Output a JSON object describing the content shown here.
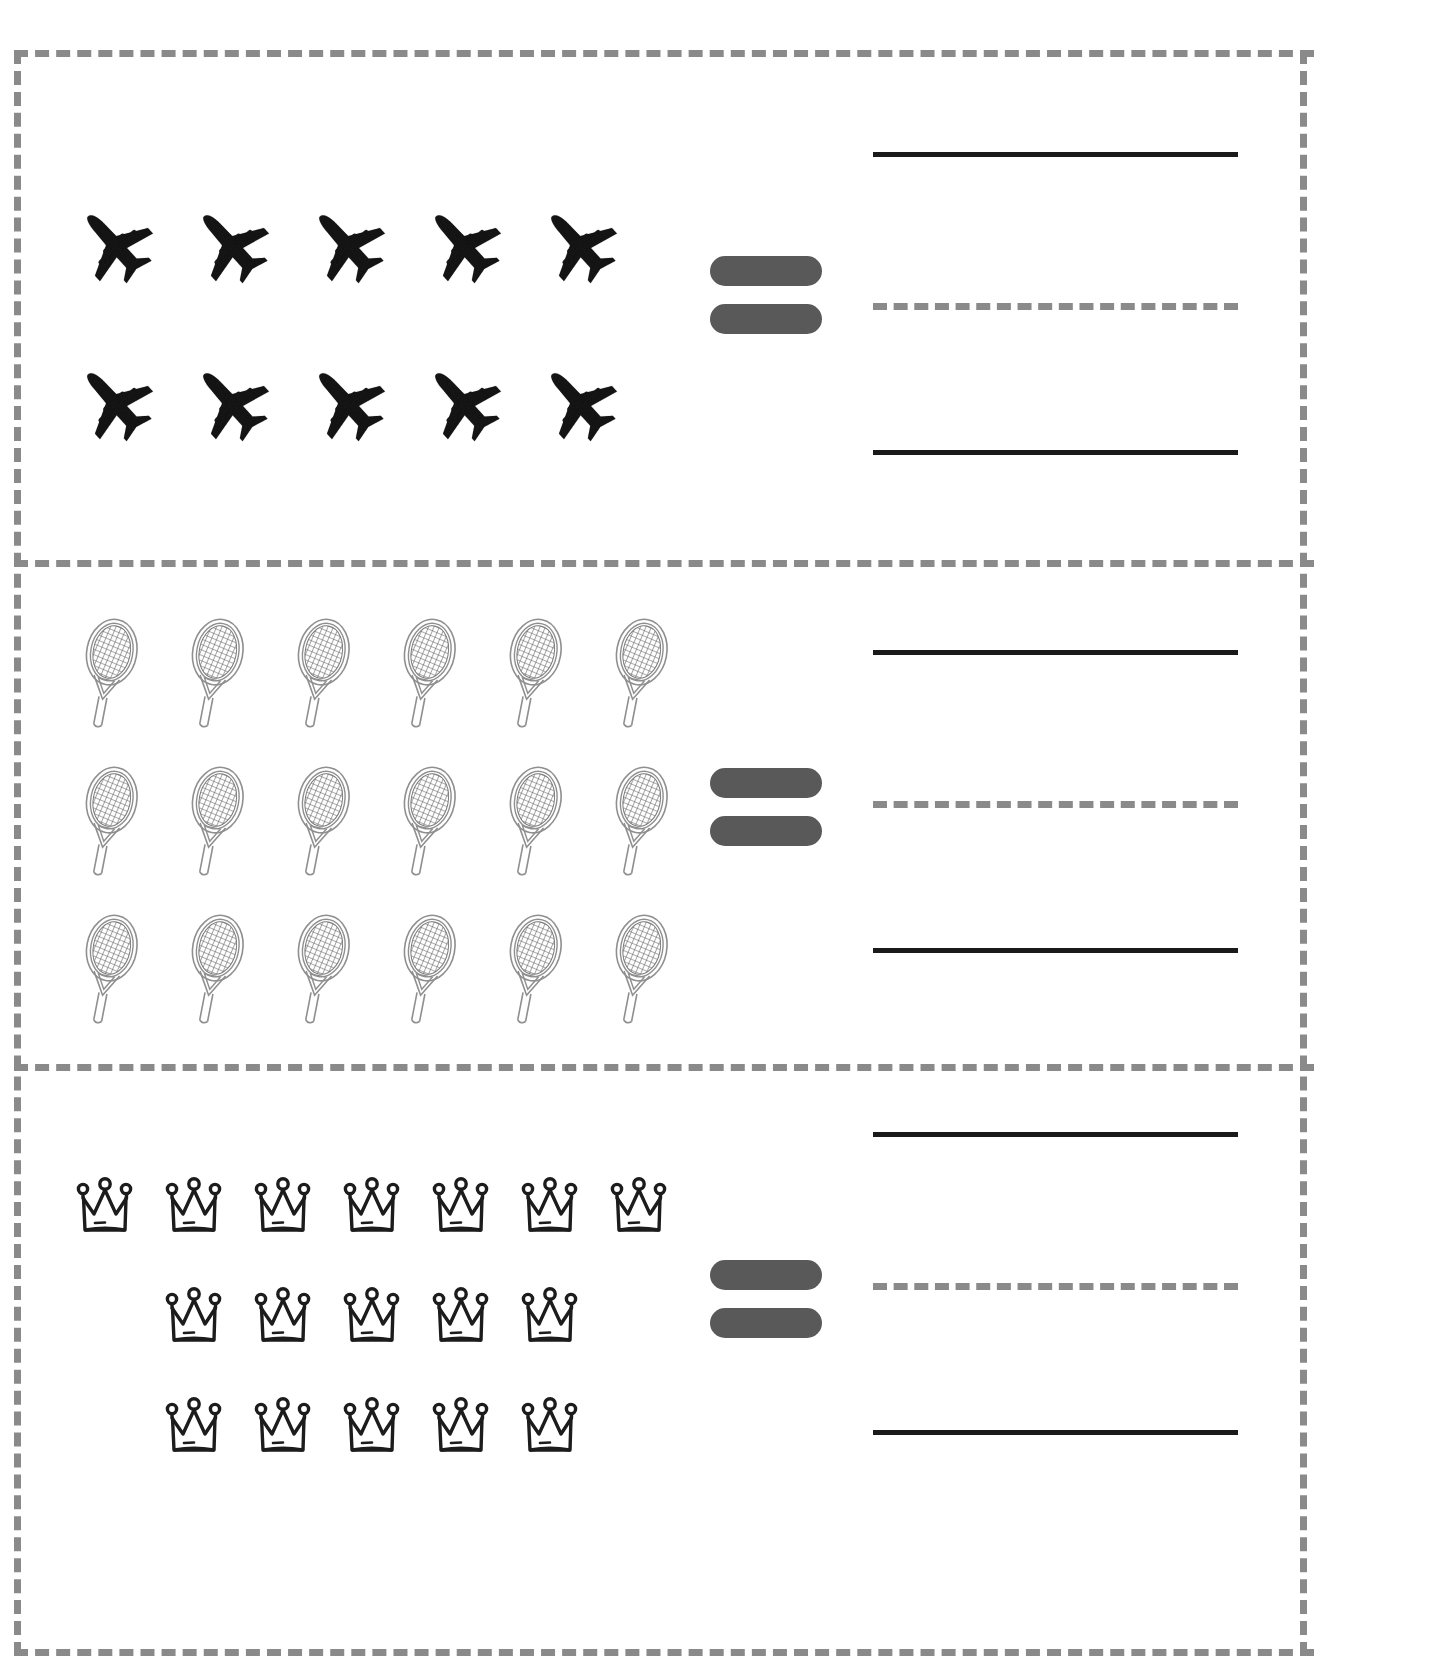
{
  "worksheet": {
    "title": "Counting Picture Groups Equals Worksheet",
    "border_style": "dashed",
    "border_color": "#8a8a8a",
    "background_color": "#ffffff",
    "equals_color": "#595959",
    "line_color": "#1a1a1a"
  },
  "problems": [
    {
      "id": "problem-1",
      "icon_name": "airplane-icon",
      "icon_label": "airplane",
      "rows": [
        5,
        5
      ],
      "total": 10,
      "equals_symbol": "=",
      "answer_value": ""
    },
    {
      "id": "problem-2",
      "icon_name": "tennis-racket-icon",
      "icon_label": "tennis racket",
      "rows": [
        6,
        6,
        6
      ],
      "total": 18,
      "equals_symbol": "=",
      "answer_value": ""
    },
    {
      "id": "problem-3",
      "icon_name": "crown-icon",
      "icon_label": "crown",
      "rows": [
        7,
        5,
        5
      ],
      "total": 17,
      "equals_symbol": "=",
      "answer_value": ""
    }
  ],
  "answer_lines": {
    "top_label": "solid-line",
    "middle_label": "dashed-guide-line",
    "bottom_label": "solid-line"
  }
}
